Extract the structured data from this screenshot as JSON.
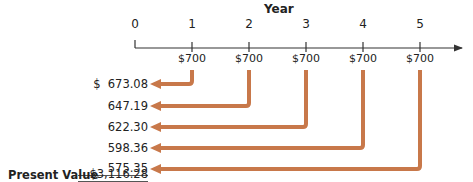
{
  "diagram": {
    "axis_title": "Year",
    "periods": [
      "0",
      "1",
      "2",
      "3",
      "4",
      "5"
    ],
    "cash_flows": [
      "$700",
      "$700",
      "$700",
      "$700",
      "$700"
    ],
    "present_values": [
      {
        "label": "$  673.08",
        "year": 1
      },
      {
        "label": "647.19",
        "year": 2
      },
      {
        "label": "622.30",
        "year": 3
      },
      {
        "label": "598.36",
        "year": 4
      },
      {
        "label": "575.35",
        "year": 5
      }
    ],
    "total_label": "Present Value",
    "total_value": "$3,116.28",
    "arrow_color": "#c8784a",
    "axis_color": "#333333"
  }
}
